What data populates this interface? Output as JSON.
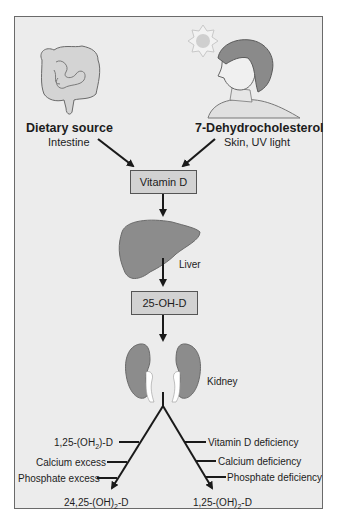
{
  "diagram": {
    "sources": {
      "left": {
        "title": "Dietary source",
        "subtitle": "Intestine",
        "icon": "intestine-icon"
      },
      "right": {
        "title": "7-Dehydrocholesterol",
        "subtitle": "Skin, UV light",
        "icon": "person-in-sun-icon"
      }
    },
    "nodes": {
      "vitamin_d": "Vitamin D",
      "liver_label": "Liver",
      "hydroxy": "25-OH-D",
      "kidney_label": "Kidney"
    },
    "branches": {
      "left": {
        "factors": [
          "1,25-(OH",
          "Calcium excess",
          "Phosphate excess"
        ],
        "factor1_sub": "2",
        "factor1_tail": ")-D",
        "product_prefix": "24,25-(OH)",
        "product_sub": "2",
        "product_suffix": "-D"
      },
      "right": {
        "factors": [
          "Vitamin D deficiency",
          "Calcium deficiency",
          "Phosphate deficiency"
        ],
        "product_prefix": "1,25-(OH)",
        "product_sub": "2",
        "product_suffix": "-D"
      }
    },
    "colors": {
      "background": "#ececec",
      "box_fill": "#d2d2d2",
      "organ": "#8a8a8a",
      "arrow": "#1a1a1a"
    }
  }
}
